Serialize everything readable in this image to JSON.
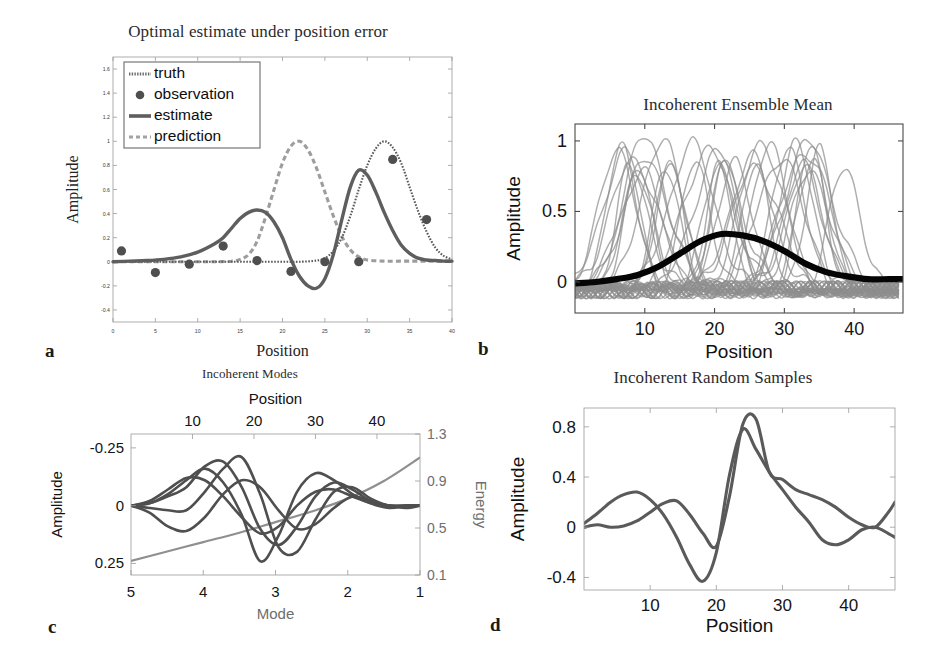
{
  "figure": {
    "panel_letters": [
      "a",
      "b",
      "c",
      "d"
    ]
  },
  "panel_a": {
    "letter": "a",
    "title": "Optimal estimate under position error",
    "xlabel": "Position",
    "ylabel": "Amplitude",
    "legend": [
      "truth",
      "observation",
      "estimate",
      "prediction"
    ],
    "xticks": [
      0,
      5,
      10,
      15,
      20,
      25,
      30,
      35,
      40
    ],
    "yticks": [
      -0.4,
      -0.2,
      0,
      0.2,
      0.4,
      0.6,
      0.8,
      1,
      1.2,
      1.4,
      1.6
    ],
    "ytick_labels": [
      "-0.4",
      "-0.2",
      "0",
      "0.2",
      "0.4",
      "0.6",
      "0.8",
      "1",
      "1.2",
      "1.4",
      "1.6"
    ]
  },
  "panel_b": {
    "letter": "b",
    "title": "Incoherent Ensemble Mean",
    "xlabel": "Position",
    "ylabel": "Amplitude",
    "xticks": [
      10,
      20,
      30,
      40
    ],
    "yticks": [
      0,
      0.5,
      1
    ],
    "ytick_labels": [
      "0",
      "0.5",
      "1"
    ]
  },
  "panel_c": {
    "letter": "c",
    "title": "Incoherent Modes",
    "xlabel_top": "Position",
    "xlabel_bottom": "Mode",
    "ylabel_left": "Amplitude",
    "ylabel_right": "Energy",
    "xticks_top": [
      10,
      20,
      30,
      40
    ],
    "xticks_bottom": [
      5,
      4,
      3,
      2,
      1
    ],
    "yticks_left": [
      -0.25,
      0,
      0.25
    ],
    "ytick_labels_left": [
      "-0.25",
      "0",
      "0.25"
    ],
    "yticks_right": [
      0.1,
      0.5,
      0.9,
      1.3
    ],
    "ytick_labels_right": [
      "0.1",
      "0.5",
      "0.9",
      "1.3"
    ]
  },
  "panel_d": {
    "letter": "d",
    "title": "Incoherent Random Samples",
    "xlabel": "Position",
    "ylabel": "Amplitude",
    "xticks": [
      10,
      20,
      30,
      40
    ],
    "yticks": [
      -0.4,
      0,
      0.4,
      0.8
    ],
    "ytick_labels": [
      "-0.4",
      "0",
      "0.4",
      "0.8"
    ]
  },
  "chart_data": [
    {
      "id": "a",
      "type": "line",
      "title": "Optimal estimate under position error",
      "xlabel": "Position",
      "ylabel": "Amplitude",
      "xlim": [
        0,
        40
      ],
      "ylim": [
        -0.5,
        1.7
      ],
      "grid": false,
      "legend": [
        "truth",
        "observation",
        "estimate",
        "prediction"
      ],
      "legend_position": "upper-left",
      "series": [
        {
          "name": "truth",
          "style": "dotted",
          "x": [
            0,
            2,
            4,
            6,
            8,
            10,
            12,
            14,
            16,
            18,
            20,
            22,
            24,
            25,
            26,
            27,
            28,
            29,
            30,
            31,
            32,
            33,
            34,
            35,
            36,
            37,
            38,
            39,
            40
          ],
          "y": [
            0,
            0,
            0,
            0,
            0,
            0,
            0,
            0,
            0,
            0,
            0,
            0,
            0.01,
            0.03,
            0.09,
            0.2,
            0.38,
            0.6,
            0.8,
            0.94,
            1.0,
            0.95,
            0.82,
            0.62,
            0.42,
            0.25,
            0.12,
            0.05,
            0.02
          ]
        },
        {
          "name": "estimate",
          "style": "solid",
          "x": [
            0,
            2,
            4,
            6,
            8,
            10,
            12,
            13,
            14,
            15,
            16,
            17,
            18,
            19,
            20,
            21,
            22,
            23,
            24,
            25,
            26,
            27,
            28,
            29,
            30,
            31,
            32,
            33,
            34,
            35,
            36,
            37,
            38,
            39,
            40
          ],
          "y": [
            0,
            0.005,
            0.01,
            0.02,
            0.04,
            0.08,
            0.15,
            0.2,
            0.28,
            0.36,
            0.41,
            0.43,
            0.41,
            0.33,
            0.2,
            0.02,
            -0.12,
            -0.2,
            -0.22,
            -0.14,
            0.06,
            0.35,
            0.62,
            0.76,
            0.72,
            0.58,
            0.41,
            0.26,
            0.14,
            0.07,
            0.03,
            0.015,
            0.01,
            0.005,
            0.005
          ]
        },
        {
          "name": "prediction",
          "style": "dash-dot",
          "x": [
            0,
            2,
            4,
            6,
            8,
            10,
            12,
            14,
            15,
            16,
            17,
            18,
            19,
            20,
            21,
            22,
            23,
            24,
            25,
            26,
            27,
            28,
            29,
            30,
            32,
            34,
            36,
            38,
            40
          ],
          "y": [
            0,
            0,
            0,
            0,
            0,
            0,
            0,
            0.005,
            0.02,
            0.06,
            0.17,
            0.37,
            0.6,
            0.82,
            0.96,
            1.0,
            0.93,
            0.78,
            0.58,
            0.38,
            0.21,
            0.1,
            0.04,
            0.015,
            0.005,
            0.005,
            0.005,
            0.005,
            0.005
          ]
        },
        {
          "name": "observation",
          "style": "markers",
          "x": [
            1,
            5,
            9,
            13,
            17,
            21,
            25,
            29,
            33,
            37
          ],
          "y": [
            0.09,
            -0.09,
            -0.02,
            0.13,
            0.01,
            -0.08,
            0.0,
            0.0,
            0.85,
            0.35
          ]
        }
      ]
    },
    {
      "id": "b",
      "type": "line",
      "title": "Incoherent Ensemble Mean",
      "xlabel": "Position",
      "ylabel": "Amplitude",
      "xlim": [
        0,
        47
      ],
      "ylim": [
        -0.22,
        1.12
      ],
      "grid": false,
      "legend_position": "none",
      "description": "Ensemble of ~40 gray displaced bump realizations with peak amplitude near 1, overlaid with the thick black ensemble-mean curve peaking near 0.34 at position 21.",
      "ensemble": {
        "n_members": 40,
        "peak_amplitude_range": [
          0.82,
          1.08
        ],
        "peak_center_range": [
          6,
          40
        ],
        "baseline_noise_range": [
          -0.16,
          0.06
        ]
      },
      "mean_curve": {
        "name": "ensemble mean",
        "x": [
          0,
          3,
          6,
          9,
          12,
          15,
          18,
          21,
          24,
          27,
          30,
          33,
          36,
          39,
          42,
          45,
          47
        ],
        "y": [
          -0.01,
          0.0,
          0.02,
          0.05,
          0.11,
          0.2,
          0.29,
          0.34,
          0.33,
          0.29,
          0.22,
          0.13,
          0.07,
          0.04,
          0.02,
          0.02,
          0.02
        ]
      }
    },
    {
      "id": "c",
      "type": "line",
      "title": "Incoherent Modes",
      "xlabel_top": "Position",
      "xlabel_bottom": "Mode",
      "ylabel_left": "Amplitude",
      "ylabel_right": "Energy",
      "xlim_top": [
        0,
        47
      ],
      "xlim_bottom": [
        5,
        1
      ],
      "ylim_left": [
        0.3,
        -0.31
      ],
      "ylim_right": [
        0.1,
        1.3
      ],
      "grid": false,
      "legend_position": "none",
      "note": "Left amplitude axis is inverted (-0.25 at top, 0.25 at bottom). Bottom Mode axis runs 5 to 1, right to left.",
      "modes": [
        {
          "name": "mode 1",
          "x": [
            0,
            3,
            6,
            9,
            12,
            15,
            18,
            21,
            24,
            27,
            30,
            33,
            36,
            39,
            42,
            45,
            47
          ],
          "y": [
            0,
            -0.02,
            -0.07,
            -0.12,
            -0.11,
            -0.04,
            0.05,
            0.12,
            0.09,
            0.0,
            -0.06,
            -0.07,
            -0.04,
            -0.01,
            0.0,
            0.0,
            0.0
          ]
        },
        {
          "name": "mode 2",
          "x": [
            0,
            3,
            6,
            9,
            12,
            15,
            18,
            21,
            24,
            27,
            30,
            33,
            36,
            39,
            42,
            45,
            47
          ],
          "y": [
            0,
            0.03,
            0.09,
            0.11,
            0.05,
            -0.05,
            -0.11,
            -0.08,
            0.02,
            0.1,
            0.08,
            0.01,
            -0.04,
            -0.02,
            0.0,
            0.0,
            0.0
          ]
        },
        {
          "name": "mode 3",
          "x": [
            0,
            3,
            6,
            9,
            12,
            15,
            18,
            21,
            24,
            27,
            30,
            33,
            36,
            39,
            42,
            45,
            47
          ],
          "y": [
            0,
            -0.01,
            -0.04,
            -0.08,
            -0.17,
            -0.19,
            -0.08,
            0.1,
            0.17,
            0.09,
            -0.04,
            -0.1,
            -0.07,
            -0.02,
            0.0,
            0.01,
            0.0
          ]
        },
        {
          "name": "mode 4",
          "x": [
            0,
            3,
            6,
            9,
            12,
            15,
            18,
            21,
            24,
            27,
            30,
            33,
            36,
            39,
            42,
            45,
            47
          ],
          "y": [
            0,
            0.01,
            0.02,
            0.02,
            -0.06,
            -0.16,
            -0.21,
            -0.05,
            0.18,
            0.2,
            0.06,
            -0.06,
            -0.08,
            -0.03,
            0.0,
            0.0,
            0.0
          ]
        },
        {
          "name": "mode 5",
          "x": [
            0,
            3,
            6,
            9,
            12,
            15,
            18,
            21,
            24,
            27,
            30,
            33,
            36,
            39,
            42,
            45,
            47
          ],
          "y": [
            0,
            -0.01,
            -0.05,
            -0.11,
            -0.16,
            -0.1,
            0.04,
            0.24,
            0.13,
            -0.06,
            -0.14,
            -0.11,
            -0.05,
            -0.01,
            0.01,
            0.0,
            0.0
          ]
        }
      ],
      "energy": {
        "name": "energy",
        "mode": [
          5,
          4.5,
          4,
          3.5,
          3,
          2.5,
          2,
          1.5,
          1
        ],
        "value": [
          0.22,
          0.3,
          0.38,
          0.46,
          0.55,
          0.64,
          0.75,
          0.9,
          1.1
        ]
      }
    },
    {
      "id": "d",
      "type": "line",
      "title": "Incoherent Random Samples",
      "xlabel": "Position",
      "ylabel": "Amplitude",
      "xlim": [
        0,
        47
      ],
      "ylim": [
        -0.5,
        0.95
      ],
      "grid": false,
      "legend_position": "none",
      "series": [
        {
          "name": "sample 1",
          "x": [
            0,
            2,
            4,
            6,
            8,
            10,
            12,
            14,
            16,
            18,
            20,
            22,
            24,
            26,
            28,
            30,
            32,
            34,
            36,
            38,
            40,
            42,
            44,
            46,
            47
          ],
          "y": [
            0.03,
            0.11,
            0.2,
            0.26,
            0.28,
            0.22,
            0.1,
            -0.08,
            -0.3,
            -0.43,
            -0.2,
            0.42,
            0.78,
            0.62,
            0.44,
            0.3,
            0.16,
            0.04,
            -0.1,
            -0.14,
            -0.1,
            -0.02,
            0.0,
            -0.05,
            -0.08
          ]
        },
        {
          "name": "sample 2",
          "x": [
            0,
            2,
            4,
            6,
            8,
            10,
            12,
            14,
            16,
            18,
            20,
            22,
            24,
            26,
            28,
            30,
            32,
            34,
            36,
            38,
            40,
            42,
            44,
            46,
            47
          ],
          "y": [
            0.0,
            0.02,
            0.0,
            0.01,
            0.05,
            0.12,
            0.19,
            0.21,
            0.1,
            -0.05,
            -0.15,
            0.25,
            0.82,
            0.86,
            0.44,
            0.38,
            0.3,
            0.26,
            0.22,
            0.16,
            0.08,
            0.02,
            0.0,
            0.12,
            0.2
          ]
        }
      ]
    }
  ]
}
